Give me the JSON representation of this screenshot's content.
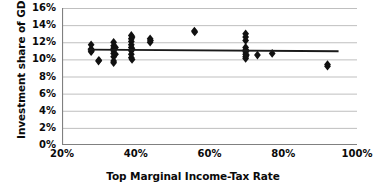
{
  "chart_data": {
    "type": "scatter",
    "title": "",
    "xlabel": "Top Marginal Income-Tax Rate",
    "ylabel": "Investment share of GDP",
    "xlim": [
      20,
      100
    ],
    "ylim": [
      0,
      16
    ],
    "xticks": [
      20,
      40,
      60,
      80,
      100
    ],
    "xtick_labels": [
      "20%",
      "40%",
      "60%",
      "80%",
      "100%"
    ],
    "yticks": [
      0,
      2,
      4,
      6,
      8,
      10,
      12,
      14,
      16
    ],
    "ytick_labels": [
      "0%",
      "2%",
      "4%",
      "6%",
      "8%",
      "10%",
      "12%",
      "14%",
      "16%"
    ],
    "grid": "horizontal",
    "legend": "none",
    "marker": "diamond",
    "marker_color": "#111111",
    "series": [
      {
        "name": "Countries",
        "points": [
          [
            27.9,
            11.7
          ],
          [
            27.9,
            11.2
          ],
          [
            27.9,
            10.9
          ],
          [
            28.0,
            11.0
          ],
          [
            29.9,
            9.8
          ],
          [
            30.0,
            9.9
          ],
          [
            34.0,
            12.0
          ],
          [
            34.0,
            11.6
          ],
          [
            34.0,
            11.3
          ],
          [
            34.0,
            11.0
          ],
          [
            34.0,
            10.7
          ],
          [
            34.0,
            10.3
          ],
          [
            34.0,
            9.8
          ],
          [
            34.0,
            9.6
          ],
          [
            34.5,
            11.4
          ],
          [
            34.5,
            10.6
          ],
          [
            38.8,
            12.8
          ],
          [
            38.8,
            12.4
          ],
          [
            38.8,
            12.1
          ],
          [
            38.8,
            11.7
          ],
          [
            38.8,
            11.4
          ],
          [
            38.8,
            11.0
          ],
          [
            38.8,
            10.6
          ],
          [
            38.8,
            10.2
          ],
          [
            39.0,
            12.6
          ],
          [
            39.0,
            11.2
          ],
          [
            39.0,
            10.0
          ],
          [
            43.9,
            12.4
          ],
          [
            43.9,
            12.0
          ],
          [
            44.0,
            12.2
          ],
          [
            55.9,
            13.3
          ],
          [
            56.0,
            13.2
          ],
          [
            69.8,
            13.0
          ],
          [
            69.8,
            12.6
          ],
          [
            69.8,
            12.2
          ],
          [
            69.8,
            11.4
          ],
          [
            69.8,
            11.1
          ],
          [
            69.8,
            10.9
          ],
          [
            69.8,
            10.6
          ],
          [
            69.8,
            10.3
          ],
          [
            69.8,
            10.1
          ],
          [
            70.0,
            11.0
          ],
          [
            70.0,
            10.5
          ],
          [
            73.0,
            10.5
          ],
          [
            77.0,
            10.7
          ],
          [
            92.0,
            9.4
          ],
          [
            92.0,
            9.2
          ]
        ]
      }
    ],
    "trendline": {
      "name": "Linear trend",
      "color": "#1a1a1a",
      "x_start": 27.0,
      "y_start": 11.15,
      "x_end": 95.0,
      "y_end": 10.95
    }
  },
  "axes": {
    "axis_line_color": "#808080",
    "gridline_color": "#bfbfbf"
  }
}
